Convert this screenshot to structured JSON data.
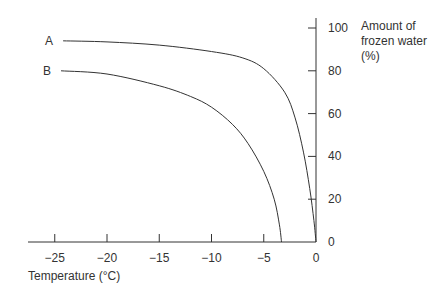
{
  "chart_data": {
    "type": "line",
    "title": "",
    "xlabel": "Temperature (°C)",
    "ylabel": "Amount of frozen water (%)",
    "ylabel_lines": [
      "Amount of",
      "frozen water",
      "(%)"
    ],
    "xlim": [
      -27,
      0
    ],
    "ylim": [
      0,
      100
    ],
    "x_ticks": [
      -25,
      -20,
      -15,
      -10,
      -5,
      0
    ],
    "x_tick_labels": [
      "−25",
      "−20",
      "−15",
      "−10",
      "−5",
      "0"
    ],
    "y_ticks": [
      0,
      20,
      40,
      60,
      80,
      100
    ],
    "y_tick_labels": [
      "0",
      "20",
      "40",
      "60",
      "80",
      "100"
    ],
    "grid": false,
    "legend": "inline labels at left end of curves",
    "series": [
      {
        "name": "A",
        "x": [
          -24.2,
          -20,
          -15,
          -10,
          -7,
          -5,
          -3,
          -2,
          -1.2,
          -0.6,
          -0.2,
          0
        ],
        "y": [
          94,
          93.5,
          92,
          89,
          86,
          81,
          70,
          58,
          42,
          25,
          10,
          0
        ]
      },
      {
        "name": "B",
        "x": [
          -24.4,
          -20,
          -15,
          -12,
          -10,
          -8,
          -6.5,
          -5,
          -4,
          -3.5,
          -3.3
        ],
        "y": [
          80,
          78.5,
          73,
          68,
          63,
          55,
          46,
          33,
          20,
          8,
          0
        ]
      }
    ]
  }
}
